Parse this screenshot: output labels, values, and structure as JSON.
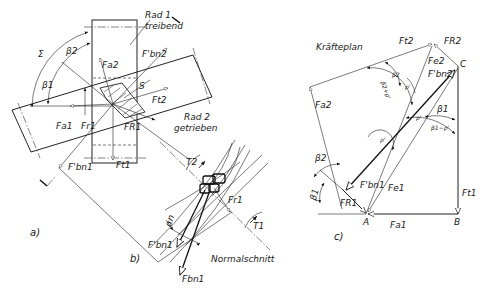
{
  "figure": {
    "panels": [
      {
        "id": "a",
        "label": "a)"
      },
      {
        "id": "b",
        "label": "b)"
      },
      {
        "id": "c",
        "label": "c)"
      }
    ]
  },
  "panel_a": {
    "gear1": {
      "name": "Rad 1",
      "role": "treibend"
    },
    "gear2": {
      "name": "Rad 2",
      "role": "getrieben"
    },
    "point_label": "S",
    "angles": {
      "sigma": "Σ",
      "beta1": "β1",
      "beta2": "β2"
    },
    "forces": {
      "Fa1": "Fa1",
      "Fa2": "Fa2",
      "Fr1": "Fr1",
      "FR1": "FR1",
      "Ft1": "Ft1",
      "Ft2": "Ft2",
      "Fbn1": "F'bn1",
      "Fbn2": "F'bn2"
    }
  },
  "panel_b": {
    "title": "Normalschnitt",
    "labels": {
      "T1": "T1",
      "T2": "T2",
      "alpha_n": "αn",
      "Fr1": "Fr1",
      "Fbn1_prime": "F'bn1",
      "Fbn1": "Fbn1"
    }
  },
  "panel_c": {
    "title": "Kräfteplan",
    "points": {
      "A": "A",
      "B": "B",
      "C": "C"
    },
    "forces": {
      "Ft2": "Ft2",
      "FR2": "FR2",
      "Fe2": "Fe2",
      "Fbn2": "F'bn2",
      "Fa2": "Fa2",
      "Fbn1": "F'bn1",
      "Fe1": "Fe1",
      "FR1": "FR1",
      "Fa1": "Fa1",
      "Ft1": "Ft1"
    },
    "angles": {
      "beta1": "β1",
      "beta2": "β2",
      "rho": "ρ'",
      "beta1_minus_rho": "β1−ρ'",
      "beta2_plus_rho": "β2+ρ'"
    }
  }
}
